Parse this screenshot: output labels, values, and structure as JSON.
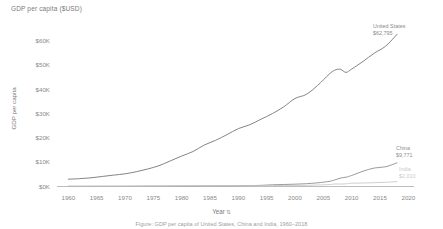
{
  "chart_data": {
    "type": "line",
    "title": "GDP per capita ($USD)",
    "xlabel": "Year",
    "ylabel": "GDP per capita",
    "xlim": [
      1958,
      2021
    ],
    "ylim": [
      0,
      65000
    ],
    "grid": false,
    "legend_position": "right-inline-labels",
    "x_tick_labels": [
      "1960",
      "1965",
      "1970",
      "1975",
      "1980",
      "1985",
      "1990",
      "1995",
      "2000",
      "2005",
      "2010",
      "2015",
      "2020"
    ],
    "x_ticks": [
      1960,
      1965,
      1970,
      1975,
      1980,
      1985,
      1990,
      1995,
      2000,
      2005,
      2010,
      2015,
      2020
    ],
    "y_tick_labels": [
      "$60K",
      "$50K",
      "$40K",
      "$30K",
      "$20K",
      "$10K",
      "$0K"
    ],
    "y_ticks": [
      60000,
      50000,
      40000,
      30000,
      20000,
      10000,
      0
    ],
    "x": [
      1960,
      1962,
      1964,
      1966,
      1968,
      1970,
      1972,
      1974,
      1976,
      1978,
      1980,
      1982,
      1984,
      1986,
      1988,
      1990,
      1992,
      1994,
      1996,
      1998,
      2000,
      2002,
      2004,
      2006,
      2007,
      2008,
      2009,
      2010,
      2012,
      2014,
      2016,
      2018
    ],
    "series": [
      {
        "name": "United States",
        "end_value_label": "$62,795",
        "color": "#7d7d7d",
        "values": [
          3007,
          3244,
          3574,
          4146,
          4696,
          5234,
          6094,
          7226,
          8592,
          10565,
          12575,
          14433,
          17121,
          19072,
          21417,
          23889,
          25467,
          27777,
          30068,
          32854,
          36330,
          38023,
          41725,
          46299,
          47976,
          48383,
          47100,
          48468,
          51603,
          55050,
          57928,
          62795
        ]
      },
      {
        "name": "China",
        "end_value_label": "$9,771",
        "color": "#8f8f8f",
        "values": [
          89,
          70,
          85,
          98,
          89,
          113,
          132,
          160,
          165,
          185,
          195,
          203,
          251,
          282,
          284,
          318,
          366,
          473,
          709,
          829,
          959,
          1149,
          1509,
          2099,
          2694,
          3468,
          3832,
          4550,
          6301,
          7636,
          8148,
          9771
        ]
      },
      {
        "name": "India",
        "end_value_label": "$2,010",
        "color": "#c6c6c6",
        "values": [
          82,
          90,
          110,
          90,
          100,
          112,
          119,
          163,
          161,
          206,
          267,
          274,
          277,
          309,
          353,
          368,
          318,
          366,
          400,
          415,
          443,
          471,
          627,
          792,
          1028,
          999,
          1102,
          1358,
          1444,
          1574,
          1733,
          2010
        ]
      }
    ]
  },
  "labels": {
    "us_name": "United States",
    "us_value": "$62,795",
    "china_name": "China",
    "china_value": "$9,771",
    "india_name": "India",
    "india_value": "$2,010"
  },
  "axis": {
    "x_title": "Year",
    "sort_icon": "⇅",
    "y_title": "GDP per capita"
  },
  "caption": {
    "text": "Figure: GDP per capita of United States, China and India, 1960–2018"
  }
}
